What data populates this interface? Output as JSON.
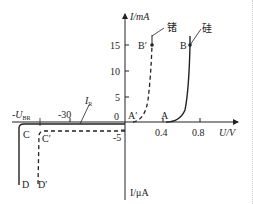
{
  "axes": {
    "y_label_top": "I/mA",
    "y_label_bottom": "I/μA",
    "x_label": "U/V",
    "y_ticks_pos": [
      "15",
      "10",
      "5"
    ],
    "y_tick_zero": "0",
    "y_tick_neg": "-5",
    "x_ticks_pos": [
      "0.4",
      "0.8"
    ],
    "x_tick_neg": "-30",
    "x_breakdown": "-U",
    "x_breakdown_sub": "BR"
  },
  "curves": {
    "germanium_label": "锗",
    "silicon_label": "硅",
    "reverse_current_label": "I",
    "reverse_current_sub": "R"
  },
  "points": {
    "A": "A",
    "A_prime": "A′",
    "B": "B",
    "B_prime": "B′",
    "C": "C",
    "C_prime": "C′",
    "D": "D",
    "D_prime": "D′"
  }
}
